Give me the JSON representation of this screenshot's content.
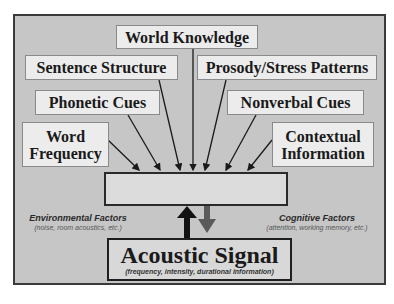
{
  "diagram": {
    "influences": [
      {
        "id": "world-knowledge",
        "label": "World Knowledge"
      },
      {
        "id": "sentence-structure",
        "label": "Sentence Structure"
      },
      {
        "id": "prosody-stress-patterns",
        "label": "Prosody/Stress Patterns"
      },
      {
        "id": "phonetic-cues",
        "label": "Phonetic Cues"
      },
      {
        "id": "nonverbal-cues",
        "label": "Nonverbal Cues"
      },
      {
        "id": "word-frequency",
        "label_line1": "Word",
        "label_line2": "Frequency"
      },
      {
        "id": "contextual-information",
        "label_line1": "Contextual",
        "label_line2": "Information"
      }
    ],
    "central_box": {
      "label": ""
    },
    "acoustic_signal": {
      "title": "Acoustic Signal",
      "subtitle": "(frequency, intensity, durational information)"
    },
    "environmental_factors": {
      "heading": "Environmental Factors",
      "detail": "(noise, room acoustics, etc.)"
    },
    "cognitive_factors": {
      "heading": "Cognitive Factors",
      "detail": "(attention, working memory, etc.)"
    },
    "colors": {
      "panel": "#c6c6c6",
      "box_fill": "#ececec",
      "up_arrow": "#111111",
      "down_arrow": "#5a5a5a"
    }
  }
}
